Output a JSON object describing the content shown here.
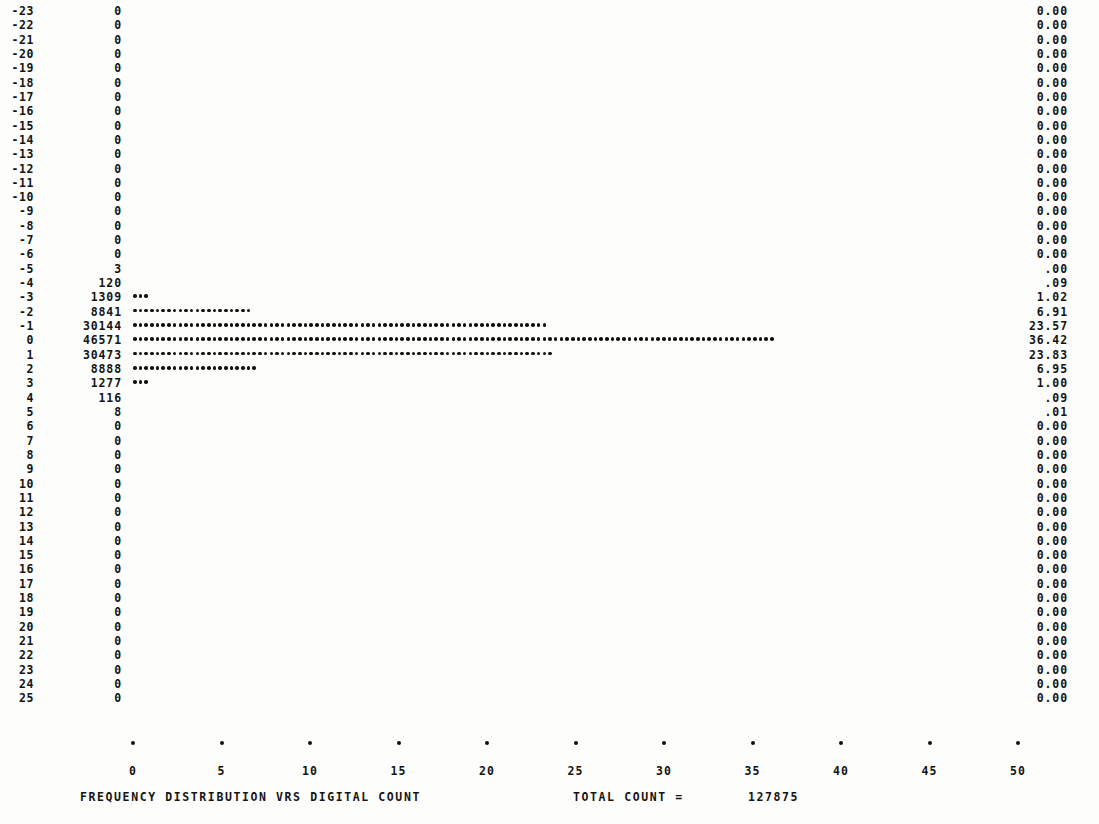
{
  "chart_data": {
    "type": "bar",
    "orientation": "horizontal",
    "title": "FREQUENCY  DISTRIBUTION VRS DIGITAL COUNT",
    "xlabel": "",
    "ylabel": "",
    "xlim": [
      0,
      50
    ],
    "xticks": [
      0,
      5,
      10,
      15,
      20,
      25,
      30,
      35,
      40,
      45,
      50
    ],
    "xtick_labels": [
      "0",
      "5",
      "10",
      "15",
      "20",
      "25",
      "30",
      "35",
      "40",
      "45",
      "50"
    ],
    "grid": false,
    "legend": null,
    "units": "percent of total count",
    "categories": [
      -23,
      -22,
      -21,
      -20,
      -19,
      -18,
      -17,
      -16,
      -15,
      -14,
      -13,
      -12,
      -11,
      -10,
      -9,
      -8,
      -7,
      -6,
      -5,
      -4,
      -3,
      -2,
      -1,
      0,
      1,
      2,
      3,
      4,
      5,
      6,
      7,
      8,
      9,
      10,
      11,
      12,
      13,
      14,
      15,
      16,
      17,
      18,
      19,
      20,
      21,
      22,
      23,
      24,
      25
    ],
    "counts": [
      0,
      0,
      0,
      0,
      0,
      0,
      0,
      0,
      0,
      0,
      0,
      0,
      0,
      0,
      0,
      0,
      0,
      0,
      3,
      120,
      1309,
      8841,
      30144,
      46571,
      30473,
      8888,
      1277,
      116,
      8,
      0,
      0,
      0,
      0,
      0,
      0,
      0,
      0,
      0,
      0,
      0,
      0,
      0,
      0,
      0,
      0,
      0,
      0,
      0,
      0
    ],
    "values": [
      0.0,
      0.0,
      0.0,
      0.0,
      0.0,
      0.0,
      0.0,
      0.0,
      0.0,
      0.0,
      0.0,
      0.0,
      0.0,
      0.0,
      0.0,
      0.0,
      0.0,
      0.0,
      0.0,
      0.09,
      1.02,
      6.91,
      23.57,
      36.42,
      23.83,
      6.95,
      1.0,
      0.09,
      0.01,
      0.0,
      0.0,
      0.0,
      0.0,
      0.0,
      0.0,
      0.0,
      0.0,
      0.0,
      0.0,
      0.0,
      0.0,
      0.0,
      0.0,
      0.0,
      0.0,
      0.0,
      0.0,
      0.0,
      0.0
    ],
    "total_count": 127875
  },
  "rows": [
    {
      "label": "-23",
      "count": "0",
      "pct": "0.00",
      "bar": 0.0
    },
    {
      "label": "-22",
      "count": "0",
      "pct": "0.00",
      "bar": 0.0
    },
    {
      "label": "-21",
      "count": "0",
      "pct": "0.00",
      "bar": 0.0
    },
    {
      "label": "-20",
      "count": "0",
      "pct": "0.00",
      "bar": 0.0
    },
    {
      "label": "-19",
      "count": "0",
      "pct": "0.00",
      "bar": 0.0
    },
    {
      "label": "-18",
      "count": "0",
      "pct": "0.00",
      "bar": 0.0
    },
    {
      "label": "-17",
      "count": "0",
      "pct": "0.00",
      "bar": 0.0
    },
    {
      "label": "-16",
      "count": "0",
      "pct": "0.00",
      "bar": 0.0
    },
    {
      "label": "-15",
      "count": "0",
      "pct": "0.00",
      "bar": 0.0
    },
    {
      "label": "-14",
      "count": "0",
      "pct": "0.00",
      "bar": 0.0
    },
    {
      "label": "-13",
      "count": "0",
      "pct": "0.00",
      "bar": 0.0
    },
    {
      "label": "-12",
      "count": "0",
      "pct": "0.00",
      "bar": 0.0
    },
    {
      "label": "-11",
      "count": "0",
      "pct": "0.00",
      "bar": 0.0
    },
    {
      "label": "-10",
      "count": "0",
      "pct": "0.00",
      "bar": 0.0
    },
    {
      "label": "-9",
      "count": "0",
      "pct": "0.00",
      "bar": 0.0
    },
    {
      "label": "-8",
      "count": "0",
      "pct": "0.00",
      "bar": 0.0
    },
    {
      "label": "-7",
      "count": "0",
      "pct": "0.00",
      "bar": 0.0
    },
    {
      "label": "-6",
      "count": "0",
      "pct": "0.00",
      "bar": 0.0
    },
    {
      "label": "-5",
      "count": "3",
      "pct": ".00",
      "bar": 0.0
    },
    {
      "label": "-4",
      "count": "120",
      "pct": ".09",
      "bar": 0.09
    },
    {
      "label": "-3",
      "count": "1309",
      "pct": "1.02",
      "bar": 1.02
    },
    {
      "label": "-2",
      "count": "8841",
      "pct": "6.91",
      "bar": 6.91
    },
    {
      "label": "-1",
      "count": "30144",
      "pct": "23.57",
      "bar": 23.57
    },
    {
      "label": "0",
      "count": "46571",
      "pct": "36.42",
      "bar": 36.42
    },
    {
      "label": "1",
      "count": "30473",
      "pct": "23.83",
      "bar": 23.83
    },
    {
      "label": "2",
      "count": "8888",
      "pct": "6.95",
      "bar": 6.95
    },
    {
      "label": "3",
      "count": "1277",
      "pct": "1.00",
      "bar": 1.0
    },
    {
      "label": "4",
      "count": "116",
      "pct": ".09",
      "bar": 0.09
    },
    {
      "label": "5",
      "count": "8",
      "pct": ".01",
      "bar": 0.01
    },
    {
      "label": "6",
      "count": "0",
      "pct": "0.00",
      "bar": 0.0
    },
    {
      "label": "7",
      "count": "0",
      "pct": "0.00",
      "bar": 0.0
    },
    {
      "label": "8",
      "count": "0",
      "pct": "0.00",
      "bar": 0.0
    },
    {
      "label": "9",
      "count": "0",
      "pct": "0.00",
      "bar": 0.0
    },
    {
      "label": "10",
      "count": "0",
      "pct": "0.00",
      "bar": 0.0
    },
    {
      "label": "11",
      "count": "0",
      "pct": "0.00",
      "bar": 0.0
    },
    {
      "label": "12",
      "count": "0",
      "pct": "0.00",
      "bar": 0.0
    },
    {
      "label": "13",
      "count": "0",
      "pct": "0.00",
      "bar": 0.0
    },
    {
      "label": "14",
      "count": "0",
      "pct": "0.00",
      "bar": 0.0
    },
    {
      "label": "15",
      "count": "0",
      "pct": "0.00",
      "bar": 0.0
    },
    {
      "label": "16",
      "count": "0",
      "pct": "0.00",
      "bar": 0.0
    },
    {
      "label": "17",
      "count": "0",
      "pct": "0.00",
      "bar": 0.0
    },
    {
      "label": "18",
      "count": "0",
      "pct": "0.00",
      "bar": 0.0
    },
    {
      "label": "19",
      "count": "0",
      "pct": "0.00",
      "bar": 0.0
    },
    {
      "label": "20",
      "count": "0",
      "pct": "0.00",
      "bar": 0.0
    },
    {
      "label": "21",
      "count": "0",
      "pct": "0.00",
      "bar": 0.0
    },
    {
      "label": "22",
      "count": "0",
      "pct": "0.00",
      "bar": 0.0
    },
    {
      "label": "23",
      "count": "0",
      "pct": "0.00",
      "bar": 0.0
    },
    {
      "label": "24",
      "count": "0",
      "pct": "0.00",
      "bar": 0.0
    },
    {
      "label": "25",
      "count": "0",
      "pct": "0.00",
      "bar": 0.0
    }
  ],
  "axis": {
    "ticks": [
      "0",
      "5",
      "10",
      "15",
      "20",
      "25",
      "30",
      "35",
      "40",
      "45",
      "50"
    ],
    "tick_glyph": "axis-tick-dot"
  },
  "caption": {
    "title": "FREQUENCY  DISTRIBUTION VRS DIGITAL COUNT",
    "total_label": "TOTAL COUNT =",
    "total_value": "127875"
  },
  "layout": {
    "row_top_px": 4,
    "row_pitch_px": 14.32,
    "bar_origin_px": 133,
    "px_per_unit": 17.7,
    "dot_pitch_px": 5.7
  },
  "colors": {
    "ink": "#141414",
    "paper": "#fdfdfb"
  }
}
